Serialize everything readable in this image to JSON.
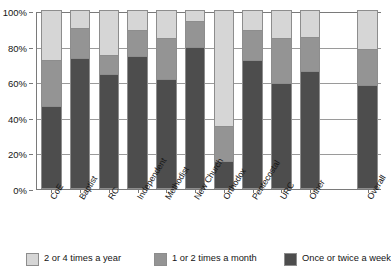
{
  "chart_data": {
    "type": "bar",
    "subtype": "stacked-bar-100",
    "title": "",
    "xlabel": "",
    "ylabel": "",
    "ylim": [
      0,
      100
    ],
    "ytick_labels": [
      "0%",
      "20%",
      "40%",
      "60%",
      "80%",
      "100%"
    ],
    "ytick_values": [
      0,
      20,
      40,
      60,
      80,
      100
    ],
    "grid": true,
    "legend_position": "bottom",
    "categories": [
      "CoE",
      "Baptist",
      "RC",
      "Independent",
      "Methodist",
      "New Church",
      "Orthodox",
      "Pentecostal",
      "URC",
      "Other",
      "Overall"
    ],
    "series": [
      {
        "name": "Once or twice a week",
        "color": "#4d4d4d",
        "values": [
          46,
          73,
          64,
          74,
          61,
          79,
          15,
          72,
          59,
          66,
          58
        ]
      },
      {
        "name": "1 or 2 times a month",
        "color": "#949494",
        "values": [
          26,
          17,
          11,
          15,
          23,
          15,
          20,
          17,
          25,
          19,
          20
        ]
      },
      {
        "name": "2 or 4 times a year",
        "color": "#d6d6d6",
        "values": [
          28,
          10,
          25,
          11,
          16,
          6,
          65,
          11,
          16,
          15,
          22
        ]
      }
    ],
    "cumulative_tops": {
      "once_or_twice_a_week": [
        46,
        73,
        64,
        74,
        61,
        79,
        15,
        72,
        59,
        66,
        58
      ],
      "plus_1_or_2_times_a_month": [
        72,
        90,
        75,
        89,
        84,
        94,
        35,
        89,
        84,
        85,
        78
      ],
      "plus_2_or_4_times_a_year": [
        100,
        100,
        100,
        100,
        100,
        100,
        100,
        100,
        100,
        100,
        100
      ]
    }
  },
  "legend": {
    "items": [
      {
        "label": "2 or 4 times a year",
        "color": "#d6d6d6"
      },
      {
        "label": "1 or 2 times a month",
        "color": "#949494"
      },
      {
        "label": "Once or twice a week",
        "color": "#4d4d4d"
      }
    ]
  },
  "axis": {
    "y_labels": [
      "100%",
      "80%",
      "60%",
      "40%",
      "20%",
      "0%"
    ],
    "x_labels": [
      "CoE",
      "Baptist",
      "RC",
      "Independent",
      "Methodist",
      "New Church",
      "Orthodox",
      "Pentecostal",
      "URC",
      "Other",
      "Overall"
    ]
  }
}
